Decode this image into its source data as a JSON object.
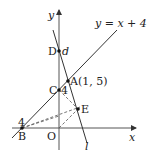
{
  "diagram": {
    "axes": {
      "x_label": "x",
      "y_label": "y",
      "origin_label": "O"
    },
    "lines": {
      "line1_label": "y = x + 4",
      "line_l_label": "l"
    },
    "points": {
      "A": {
        "label": "A(1, 5)"
      },
      "B": {
        "label": "B",
        "value_label": "4"
      },
      "C": {
        "label": "C",
        "value_label": "4"
      },
      "D": {
        "label": "D",
        "value_label": "d"
      },
      "E": {
        "label": "E"
      }
    },
    "colors": {
      "line": "#333333",
      "dashed": "#555555",
      "point": "#111111"
    }
  }
}
